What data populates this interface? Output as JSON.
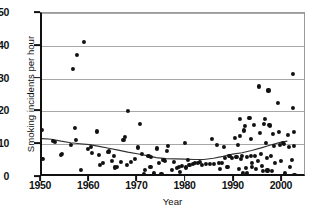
{
  "chart_data": {
    "type": "scatter",
    "title": "",
    "xlabel": "Year",
    "ylabel": "Smoking incidents per hour",
    "xlim": [
      1950,
      2005
    ],
    "ylim": [
      0,
      50
    ],
    "xticks": [
      1950,
      1960,
      1970,
      1980,
      1990,
      2000
    ],
    "yticks": [
      0,
      10,
      20,
      30,
      40,
      50
    ],
    "grid": "horizontal",
    "legend": "none",
    "point_color": "#111111",
    "trendline_color": "#333333",
    "gridline_color": "#a8a8a8",
    "series": [
      {
        "name": "Smoking incidents per hour",
        "marker": "filled-circle",
        "points": [
          [
            1950.0,
            14.3
          ],
          [
            1950.2,
            5.6
          ],
          [
            1952.3,
            10.9
          ],
          [
            1952.6,
            10.8
          ],
          [
            1953.4,
            0.2
          ],
          [
            1953.8,
            0.2
          ],
          [
            1953.9,
            6.8
          ],
          [
            1954.1,
            7.0
          ],
          [
            1955.3,
            0.2
          ],
          [
            1956.0,
            9.9
          ],
          [
            1956.4,
            33.0
          ],
          [
            1956.9,
            14.9
          ],
          [
            1957.3,
            37.2
          ],
          [
            1957.1,
            11.2
          ],
          [
            1957.6,
            0.2
          ],
          [
            1958.0,
            0.2
          ],
          [
            1958.1,
            2.1
          ],
          [
            1958.8,
            41.3
          ],
          [
            1959.6,
            8.5
          ],
          [
            1960.1,
            9.2
          ],
          [
            1960.4,
            7.4
          ],
          [
            1961.4,
            13.9
          ],
          [
            1961.8,
            6.6
          ],
          [
            1962.0,
            3.6
          ],
          [
            1962.6,
            4.3
          ],
          [
            1963.3,
            0.3
          ],
          [
            1963.6,
            7.7
          ],
          [
            1963.9,
            7.8
          ],
          [
            1964.6,
            5.0
          ],
          [
            1964.9,
            6.3
          ],
          [
            1965.2,
            2.9
          ],
          [
            1965.6,
            3.2
          ],
          [
            1966.3,
            4.6
          ],
          [
            1966.9,
            11.3
          ],
          [
            1967.2,
            12.2
          ],
          [
            1967.6,
            3.7
          ],
          [
            1967.9,
            20.1
          ],
          [
            1968.4,
            4.6
          ],
          [
            1968.8,
            0.2
          ],
          [
            1969.3,
            5.6
          ],
          [
            1969.6,
            0.2
          ],
          [
            1970.0,
            9.0
          ],
          [
            1970.4,
            16.2
          ],
          [
            1970.7,
            6.9
          ],
          [
            1971.0,
            0.2
          ],
          [
            1971.1,
            0.9
          ],
          [
            1971.4,
            2.2
          ],
          [
            1971.8,
            0.2
          ],
          [
            1972.1,
            6.3
          ],
          [
            1972.5,
            3.0
          ],
          [
            1972.7,
            6.0
          ],
          [
            1973.0,
            0.2
          ],
          [
            1973.3,
            1.3
          ],
          [
            1973.6,
            0.2
          ],
          [
            1973.9,
            8.7
          ],
          [
            1974.2,
            4.4
          ],
          [
            1974.5,
            0.2
          ],
          [
            1974.8,
            1.0
          ],
          [
            1975.2,
            5.1
          ],
          [
            1975.6,
            4.9
          ],
          [
            1975.9,
            7.9
          ],
          [
            1976.2,
            9.5
          ],
          [
            1976.5,
            0.2
          ],
          [
            1976.9,
            2.1
          ],
          [
            1977.3,
            4.6
          ],
          [
            1977.6,
            0.2
          ],
          [
            1978.0,
            2.8
          ],
          [
            1978.4,
            3.1
          ],
          [
            1978.7,
            1.6
          ],
          [
            1979.0,
            3.4
          ],
          [
            1979.3,
            0.2
          ],
          [
            1979.6,
            10.3
          ],
          [
            1979.9,
            2.9
          ],
          [
            1980.2,
            5.1
          ],
          [
            1980.6,
            3.7
          ],
          [
            1981.0,
            0.2
          ],
          [
            1981.4,
            4.0
          ],
          [
            1981.7,
            4.3
          ],
          [
            1982.0,
            0.2
          ],
          [
            1982.4,
            4.2
          ],
          [
            1982.8,
            4.6
          ],
          [
            1983.2,
            3.8
          ],
          [
            1983.6,
            0.2
          ],
          [
            1984.0,
            4.0
          ],
          [
            1984.4,
            0.2
          ],
          [
            1984.9,
            4.1
          ],
          [
            1985.3,
            11.6
          ],
          [
            1985.6,
            3.9
          ],
          [
            1986.0,
            0.2
          ],
          [
            1986.3,
            9.9
          ],
          [
            1986.7,
            4.2
          ],
          [
            1987.0,
            2.5
          ],
          [
            1987.3,
            4.4
          ],
          [
            1987.7,
            9.1
          ],
          [
            1988.0,
            5.8
          ],
          [
            1988.3,
            3.1
          ],
          [
            1988.6,
            3.0
          ],
          [
            1988.9,
            6.3
          ],
          [
            1989.2,
            0.3
          ],
          [
            1989.5,
            5.9
          ],
          [
            1989.8,
            0.3
          ],
          [
            1990.0,
            11.9
          ],
          [
            1990.2,
            6.2
          ],
          [
            1990.4,
            6.1
          ],
          [
            1990.6,
            9.8
          ],
          [
            1990.8,
            2.4
          ],
          [
            1991.0,
            17.6
          ],
          [
            1991.1,
            12.6
          ],
          [
            1991.3,
            5.5
          ],
          [
            1991.5,
            6.4
          ],
          [
            1991.7,
            1.3
          ],
          [
            1991.9,
            0.4
          ],
          [
            1992.0,
            14.2
          ],
          [
            1992.2,
            15.5
          ],
          [
            1992.3,
            2.8
          ],
          [
            1992.5,
            6.2
          ],
          [
            1992.6,
            1.2
          ],
          [
            1992.8,
            0.4
          ],
          [
            1993.0,
            18.1
          ],
          [
            1993.1,
            17.9
          ],
          [
            1993.3,
            11.5
          ],
          [
            1993.4,
            6.3
          ],
          [
            1993.5,
            3.0
          ],
          [
            1993.6,
            4.3
          ],
          [
            1993.8,
            0.4
          ],
          [
            1994.0,
            15.8
          ],
          [
            1994.2,
            6.5
          ],
          [
            1994.4,
            2.5
          ],
          [
            1994.6,
            0.4
          ],
          [
            1994.8,
            5.0
          ],
          [
            1995.0,
            27.6
          ],
          [
            1995.2,
            13.3
          ],
          [
            1995.4,
            7.1
          ],
          [
            1995.6,
            3.4
          ],
          [
            1995.8,
            1.9
          ],
          [
            1996.0,
            16.1
          ],
          [
            1996.2,
            17.6
          ],
          [
            1996.4,
            10.5
          ],
          [
            1996.6,
            5.7
          ],
          [
            1996.8,
            2.0
          ],
          [
            1997.0,
            26.4
          ],
          [
            1997.2,
            15.8
          ],
          [
            1997.4,
            15.5
          ],
          [
            1997.6,
            6.3
          ],
          [
            1997.8,
            1.9
          ],
          [
            1998.0,
            13.0
          ],
          [
            1998.2,
            9.4
          ],
          [
            1998.4,
            4.4
          ],
          [
            1998.6,
            0.3
          ],
          [
            1998.8,
            0.3
          ],
          [
            1999.0,
            22.6
          ],
          [
            1999.2,
            13.6
          ],
          [
            1999.4,
            9.9
          ],
          [
            1999.6,
            5.0
          ],
          [
            1999.8,
            0.3
          ],
          [
            2000.0,
            10.3
          ],
          [
            2000.2,
            10.0
          ],
          [
            2000.4,
            1.2
          ],
          [
            2000.6,
            0.3
          ],
          [
            2000.8,
            0.3
          ],
          [
            2001.0,
            12.9
          ],
          [
            2001.2,
            9.1
          ],
          [
            2001.4,
            3.0
          ],
          [
            2001.6,
            0.3
          ],
          [
            2001.8,
            5.2
          ],
          [
            2002.0,
            31.4
          ],
          [
            2002.1,
            21.0
          ],
          [
            2002.2,
            13.7
          ],
          [
            2002.3,
            9.5
          ],
          [
            2002.4,
            0.6
          ]
        ]
      }
    ],
    "trendline": {
      "name": "smoothed trend",
      "points": [
        [
          1950.0,
          11.0
        ],
        [
          1952.0,
          10.8
        ],
        [
          1954.0,
          10.2
        ],
        [
          1956.0,
          9.7
        ],
        [
          1958.0,
          9.4
        ],
        [
          1960.0,
          9.1
        ],
        [
          1962.0,
          8.6
        ],
        [
          1964.0,
          8.0
        ],
        [
          1966.0,
          7.4
        ],
        [
          1968.0,
          6.8
        ],
        [
          1970.0,
          6.3
        ],
        [
          1972.0,
          5.7
        ],
        [
          1974.0,
          5.1
        ],
        [
          1976.0,
          4.8
        ],
        [
          1978.0,
          4.7
        ],
        [
          1980.0,
          4.6
        ],
        [
          1982.0,
          4.5
        ],
        [
          1984.0,
          4.5
        ],
        [
          1986.0,
          4.9
        ],
        [
          1988.0,
          5.5
        ],
        [
          1990.0,
          6.2
        ],
        [
          1992.0,
          6.6
        ],
        [
          1994.0,
          7.3
        ],
        [
          1996.0,
          8.1
        ],
        [
          1998.0,
          9.0
        ],
        [
          2000.0,
          9.8
        ],
        [
          2001.5,
          10.2
        ]
      ]
    }
  }
}
